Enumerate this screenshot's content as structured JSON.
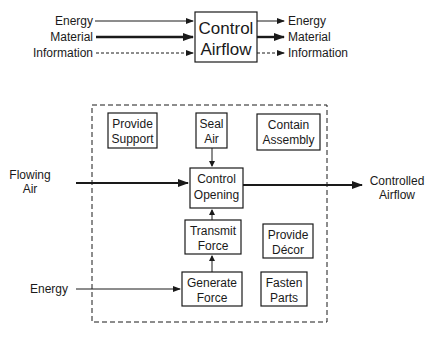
{
  "top_diagram": {
    "function": [
      "Control",
      "Airflow"
    ],
    "inputs": [
      {
        "label": "Energy",
        "flow": "energy"
      },
      {
        "label": "Material",
        "flow": "material"
      },
      {
        "label": "Information",
        "flow": "information"
      }
    ],
    "outputs": [
      {
        "label": "Energy",
        "flow": "energy"
      },
      {
        "label": "Material",
        "flow": "material"
      },
      {
        "label": "Information",
        "flow": "information"
      }
    ]
  },
  "bottom_diagram": {
    "input_air": [
      "Flowing",
      "Air"
    ],
    "output_air": [
      "Controlled",
      "Airflow"
    ],
    "input_energy": "Energy",
    "functions": {
      "provide_support": [
        "Provide",
        "Support"
      ],
      "seal_air": [
        "Seal",
        "Air"
      ],
      "contain_assembly": [
        "Contain",
        "Assembly"
      ],
      "control_opening": [
        "Control",
        "Opening"
      ],
      "transmit_force": [
        "Transmit",
        "Force"
      ],
      "provide_decor": [
        "Provide",
        "Décor"
      ],
      "generate_force": [
        "Generate",
        "Force"
      ],
      "fasten_parts": [
        "Fasten",
        "Parts"
      ]
    }
  }
}
